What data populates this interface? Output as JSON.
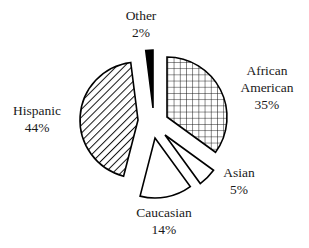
{
  "chart_data": {
    "type": "pie",
    "title": "",
    "exploded": true,
    "categories": [
      "African American",
      "Asian",
      "Caucasian",
      "Hispanic",
      "Other"
    ],
    "values": [
      35,
      5,
      14,
      44,
      2
    ],
    "unit": "%",
    "legend": "none (direct labels)",
    "slices": [
      {
        "key": "african_american",
        "label_lines": [
          "African",
          "American"
        ],
        "value": 35,
        "value_label": "35%",
        "fill": "crosshatch",
        "color": "#000000",
        "center": [
          167,
          117
        ],
        "radius": 60,
        "label_pos": [
          267,
          62
        ]
      },
      {
        "key": "asian",
        "label_lines": [
          "Asian"
        ],
        "value": 5,
        "value_label": "5%",
        "fill": "white",
        "color": "#000000",
        "center": [
          165,
          135
        ],
        "radius": 60,
        "label_pos": [
          239,
          164
        ]
      },
      {
        "key": "caucasian",
        "label_lines": [
          "Caucasian"
        ],
        "value": 14,
        "value_label": "14%",
        "fill": "white",
        "color": "#000000",
        "center": [
          155,
          138
        ],
        "radius": 60,
        "label_pos": [
          164,
          204
        ]
      },
      {
        "key": "hispanic",
        "label_lines": [
          "Hispanic"
        ],
        "value": 44,
        "value_label": "44%",
        "fill": "diagonal-stripes",
        "color": "#000000",
        "center": [
          138,
          120
        ],
        "radius": 58,
        "label_pos": [
          37,
          102
        ]
      },
      {
        "key": "other",
        "label_lines": [
          "Other"
        ],
        "value": 2,
        "value_label": "2%",
        "fill": "solid-black",
        "color": "#000000",
        "center": [
          153,
          108
        ],
        "radius": 58,
        "label_pos": [
          141,
          7
        ]
      }
    ],
    "start_angle_deg": 0,
    "direction": "clockwise"
  }
}
